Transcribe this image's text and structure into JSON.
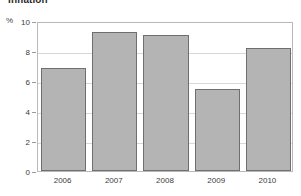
{
  "chart_data": {
    "type": "bar",
    "title": "Inflation",
    "xlabel": "",
    "ylabel": "%",
    "unit_label": "%",
    "categories": [
      "2006",
      "2007",
      "2008",
      "2009",
      "2010"
    ],
    "values": [
      6.9,
      9.3,
      9.1,
      5.5,
      8.2
    ],
    "ylim": [
      0,
      10
    ],
    "yticks": [
      0,
      2,
      4,
      6,
      8,
      10
    ],
    "ytick_labels": [
      "0",
      "2",
      "4",
      "6",
      "8",
      "10"
    ],
    "grid": true,
    "grid_axis": "y",
    "legend": false,
    "legend_position": "none",
    "series": [
      {
        "name": "Inflation",
        "values": [
          6.9,
          9.3,
          9.1,
          5.5,
          8.2
        ],
        "color": "#b4b4b4",
        "edge_color": "#6f6f6f"
      }
    ],
    "colors": {
      "bar_fill": "#b4b4b4",
      "bar_edge": "#6f6f6f",
      "gridline": "#d8d8d8",
      "frame": "#b9b9b9",
      "text": "#3c3c3c",
      "background": "#ffffff"
    }
  }
}
